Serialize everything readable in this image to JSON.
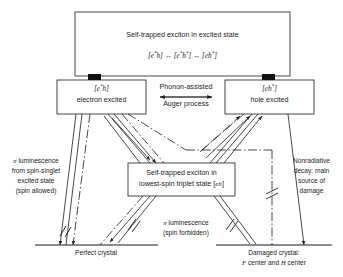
{
  "diagram": {
    "type": "energy-level / process flow diagram",
    "top_box": {
      "title": "Self-trapped exciton in excited state",
      "formula_left": "[e",
      "formula_parts": [
        "[e*h]",
        "[e*h*]",
        "[eh*]"
      ],
      "formula_plain": "[e*h] ↔ [e*h*] ↔ [eh*]"
    },
    "left_box": {
      "state": "[e*h]",
      "label": "electron excited"
    },
    "right_box": {
      "state": "[eh*]",
      "label": "hole excited"
    },
    "center_box": {
      "line1": "Self-trapped exciton in",
      "line2_pre": "lowest-spin triplet state [",
      "line2_state": "eh",
      "line2_post": "]"
    },
    "middle_arrow": {
      "line1": "Phonon-assisted",
      "line2": "Auger process"
    },
    "left_annotation": {
      "line1_symbol": "σ",
      "line1_rest": " luminescence",
      "line2": "from spin-singlet",
      "line3": "excited state",
      "line4": "(spin allowed)"
    },
    "right_annotation": {
      "line1": "Nonradiative",
      "line2": "decay: main",
      "line3": "source of",
      "line4": "damage"
    },
    "center_annotation": {
      "line1_symbol": "π",
      "line1_rest": " luminescence",
      "line2": "(spin forbidden)"
    },
    "baseline_left": {
      "label": "Perfect crystal"
    },
    "baseline_right": {
      "line1": "Damaged crystal:",
      "line2_a": "F",
      "line2_b": " center and ",
      "line2_c": "H",
      "line2_d": " center"
    },
    "colors": {
      "stroke": "#1a1a1a",
      "background": "#ffffff",
      "connector_block": "#111111"
    }
  }
}
